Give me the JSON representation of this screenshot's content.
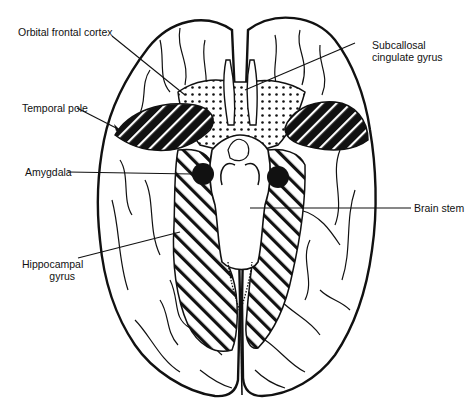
{
  "diagram": {
    "colors": {
      "ink": "#111111",
      "background": "#ffffff"
    },
    "legend_patterns": {
      "dotted": "Orbital frontal cortex / Subcallosal cingulate gyrus",
      "hatched_dark": "Temporal pole",
      "hatched_light": "Hippocampal gyrus",
      "solid": "Amygdala"
    },
    "labels": [
      {
        "id": "orbital-frontal-cortex",
        "line1": "Orbital frontal cortex",
        "line2": ""
      },
      {
        "id": "subcallosal-cingulate-gyrus",
        "line1": "Subcallosal",
        "line2": "cingulate gyrus"
      },
      {
        "id": "temporal-pole",
        "line1": "Temporal pole",
        "line2": ""
      },
      {
        "id": "amygdala",
        "line1": "Amygdala",
        "line2": ""
      },
      {
        "id": "brain-stem",
        "line1": "Brain stem",
        "line2": ""
      },
      {
        "id": "hippocampal-gyrus",
        "line1": "Hippocampal",
        "line2": "gyrus"
      }
    ]
  }
}
